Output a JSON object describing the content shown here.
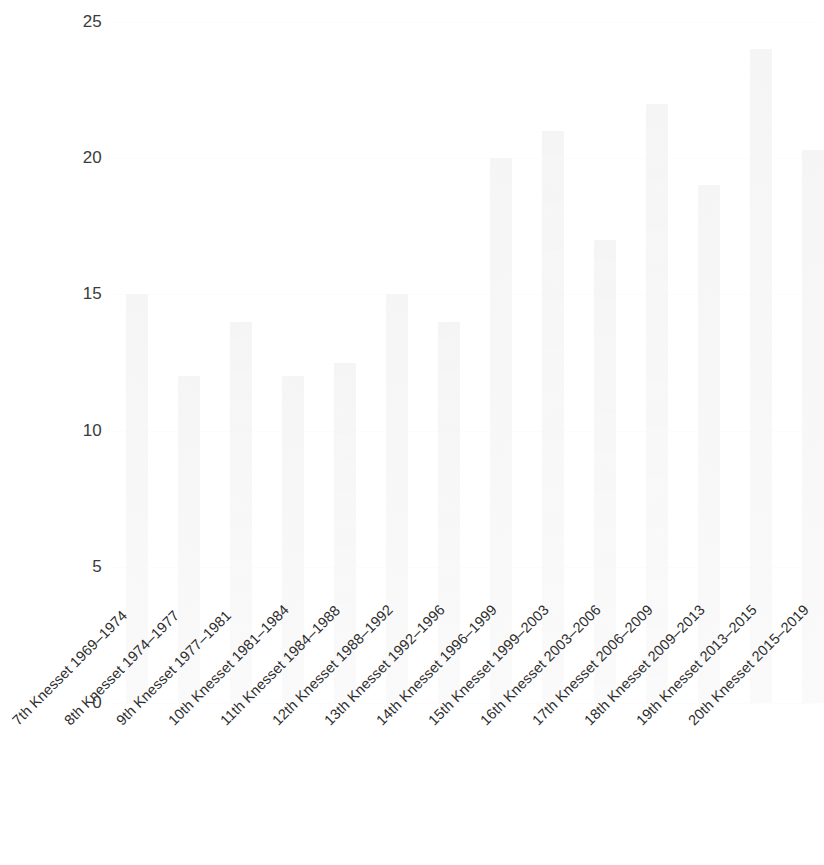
{
  "chart_data": {
    "type": "bar",
    "title": "",
    "subtitle": "",
    "xlabel": "",
    "ylabel": "",
    "ylim": [
      0,
      25
    ],
    "yticks": [
      "0",
      "5",
      "10",
      "15",
      "20",
      "25"
    ],
    "ytick_values": [
      0,
      5,
      10,
      15,
      20,
      25
    ],
    "grid": true,
    "legend": "none",
    "bar_color": "#f7f7f7",
    "categories": [
      "7th Knesset 1969–1974",
      "8th Knesset 1974–1977",
      "9th Knesset 1977–1981",
      "10th Knesset 1981–1984",
      "11th Knesset 1984–1988",
      "12th Knesset 1988–1992",
      "13th Knesset 1992–1996",
      "14th Knesset 1996–1999",
      "15th Knesset 1999–2003",
      "16th Knesset 2003–2006",
      "17th Knesset 2006–2009",
      "18th Knesset 2009–2013",
      "19th Knesset 2013–2015",
      "20th Knesset 2015–2019"
    ],
    "values": [
      15,
      12,
      14,
      12,
      12.5,
      15,
      14,
      20,
      21,
      17,
      22,
      19,
      24,
      20.3
    ]
  }
}
